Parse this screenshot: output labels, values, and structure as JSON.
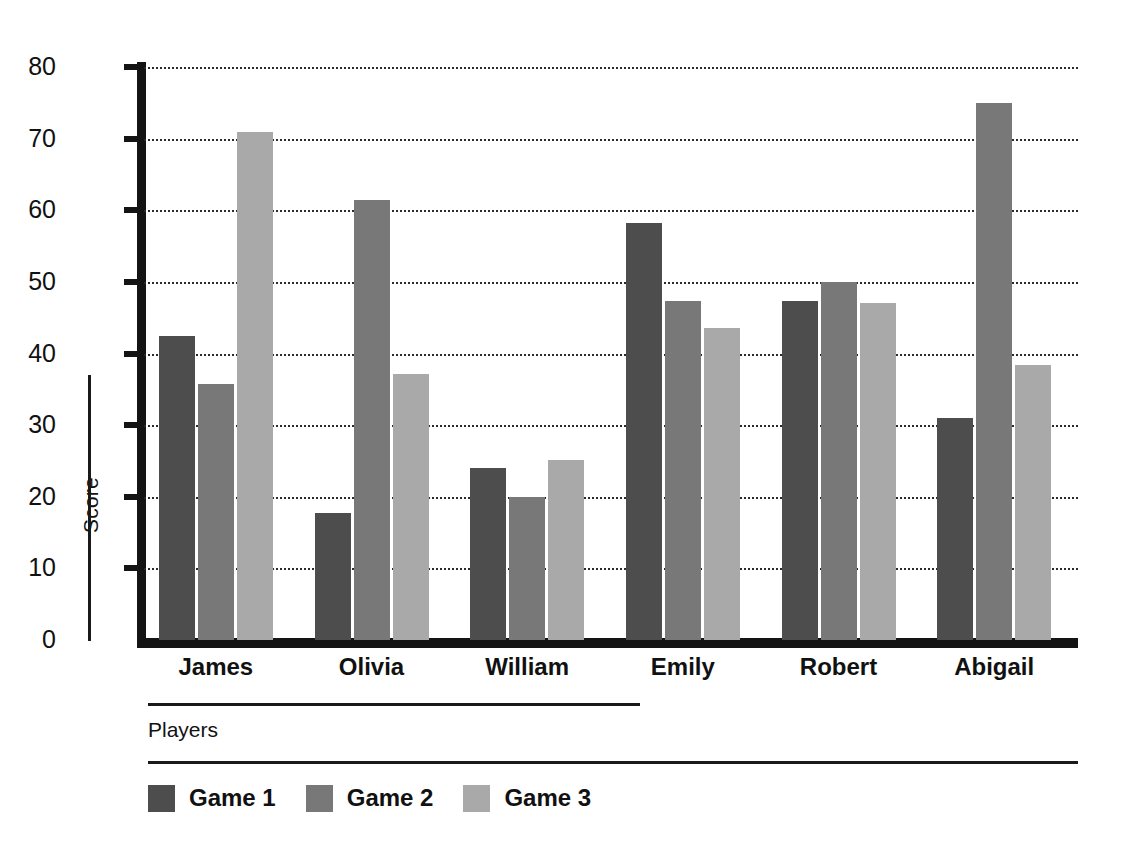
{
  "chart_data": {
    "type": "bar",
    "title": "",
    "subtitle": "",
    "xlabel": "Players",
    "ylabel": "Score",
    "categories": [
      "James",
      "Olivia",
      "William",
      "Emily",
      "Robert",
      "Abigail"
    ],
    "series": [
      {
        "name": "Game 1",
        "color": "#4d4d4d",
        "values": [
          42.5,
          17.8,
          24.0,
          58.2,
          47.4,
          31.0
        ]
      },
      {
        "name": "Game 2",
        "color": "#787878",
        "values": [
          35.7,
          61.5,
          20.0,
          47.3,
          50.0,
          75.0
        ]
      },
      {
        "name": "Game 3",
        "color": "#a9a9a9",
        "values": [
          70.9,
          37.1,
          25.1,
          43.5,
          47.1,
          38.4
        ]
      }
    ],
    "ylim": [
      0,
      80
    ],
    "yticks": [
      0,
      10,
      20,
      30,
      40,
      50,
      60,
      70,
      80
    ],
    "ytick_labels": [
      "0",
      "10",
      "20",
      "30",
      "40",
      "50",
      "60",
      "70",
      "80"
    ],
    "grid": true,
    "grid_style": "dotted",
    "grid_axis": "y",
    "legend_position": "bottom-left",
    "background": "#ffffff",
    "axis_color": "#141414"
  }
}
